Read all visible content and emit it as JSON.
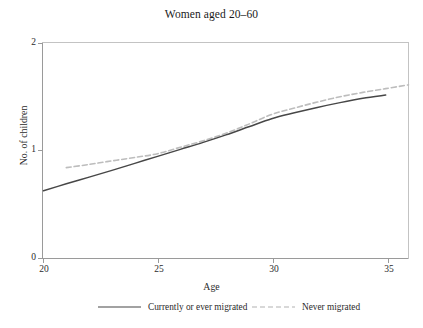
{
  "chart_data": {
    "type": "line",
    "title": "Women aged 20–60",
    "xlabel": "Age",
    "ylabel": "No. of children",
    "xlim": [
      20,
      36
    ],
    "ylim": [
      0,
      2
    ],
    "xticks": [
      "20",
      "25",
      "30",
      "35"
    ],
    "xtick_values": [
      20,
      25,
      30,
      35
    ],
    "yticks": [
      "0",
      "1",
      "2"
    ],
    "ytick_values": [
      0,
      1,
      2
    ],
    "grid": false,
    "legend_position": "below",
    "series": [
      {
        "name": "Currently or ever migrated",
        "style": "solid",
        "color": "#474747",
        "x": [
          20,
          21,
          22,
          23,
          24,
          25,
          26,
          27,
          28,
          29,
          30,
          31,
          32,
          33,
          34,
          35
        ],
        "values": [
          0.63,
          0.695,
          0.757,
          0.82,
          0.885,
          0.95,
          1.015,
          1.08,
          1.15,
          1.225,
          1.3,
          1.355,
          1.405,
          1.45,
          1.49,
          1.52
        ]
      },
      {
        "name": "Never migrated",
        "style": "dashed",
        "color": "#bdbdbd",
        "x": [
          21,
          22,
          23,
          24,
          25,
          26,
          27,
          28,
          29,
          30,
          31,
          32,
          33,
          34,
          35,
          36
        ],
        "values": [
          0.845,
          0.875,
          0.908,
          0.94,
          0.975,
          1.035,
          1.095,
          1.165,
          1.25,
          1.34,
          1.4,
          1.455,
          1.505,
          1.545,
          1.58,
          1.615
        ]
      }
    ]
  },
  "axes": {
    "line_color": "#9a9a9a",
    "frame_color": "#b5b5b5"
  }
}
